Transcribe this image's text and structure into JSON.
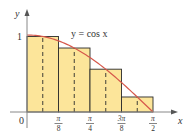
{
  "chart_data": {
    "type": "bar",
    "function_label": "y = cos x",
    "xlabel": "x",
    "ylabel": "y",
    "x_tick_labels": [
      {
        "num": "",
        "den": "",
        "text": "0"
      },
      {
        "num": "π",
        "den": "8"
      },
      {
        "num": "π",
        "den": "4"
      },
      {
        "num": "3π",
        "den": "8"
      },
      {
        "num": "π",
        "den": "2"
      }
    ],
    "y_tick_labels": [
      "1"
    ],
    "categories": [
      "[0, π/8]",
      "[π/8, π/4]",
      "[π/4, 3π/8]",
      "[3π/8, π/2]"
    ],
    "midpoints": [
      "π/16",
      "3π/16",
      "5π/16",
      "7π/16"
    ],
    "values": [
      0.981,
      0.831,
      0.556,
      0.195
    ],
    "xlim": [
      0,
      1.5708
    ],
    "ylim": [
      0,
      1
    ],
    "grid": false,
    "legend": null
  },
  "colors": {
    "bar_fill": "#fce59a",
    "bar_stroke": "#2b2b2b",
    "curve": "#d6584b",
    "axis": "#888888",
    "midpoint_dash": "#2b2b2b"
  }
}
